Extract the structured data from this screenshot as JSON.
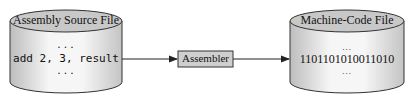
{
  "diagram": {
    "source": {
      "label": "Assembly Source File",
      "line_above": "...",
      "content": "add 2, 3, result",
      "line_below": "..."
    },
    "process": {
      "label": "Assembler"
    },
    "target": {
      "label": "Machine-Code File",
      "line_above": "...",
      "content": "1101101010011010",
      "line_below": "..."
    },
    "colors": {
      "cylinder_top": "#c8c8c8",
      "cylinder_body_light": "#f4f4f4",
      "cylinder_body_dark": "#bdbdbd",
      "box_fill": "#cfcfcf",
      "stroke": "#333333"
    }
  }
}
